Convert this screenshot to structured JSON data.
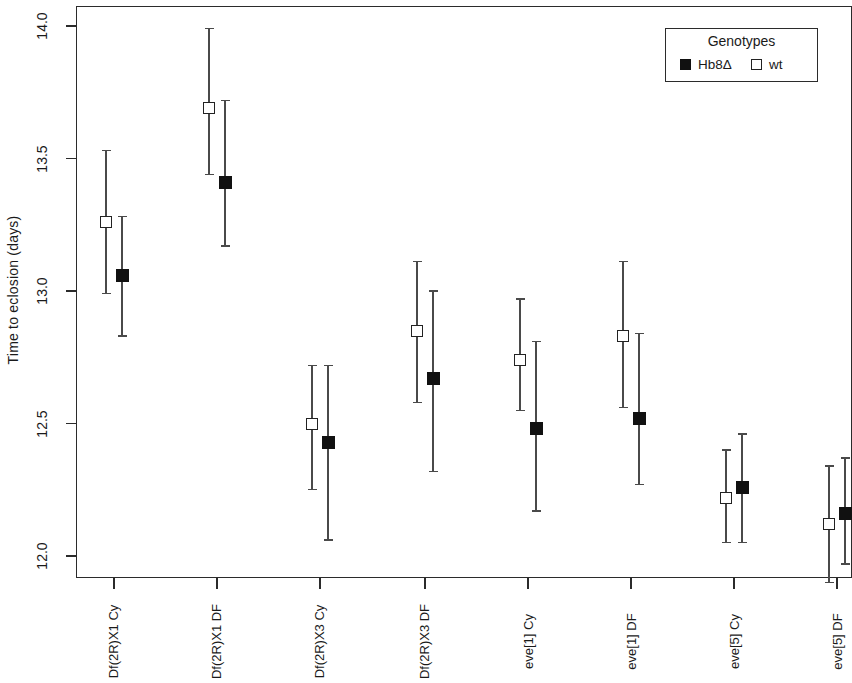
{
  "chart_data": {
    "type": "scatter",
    "title": "",
    "xlabel": "",
    "ylabel": "Time to eclosion (days)",
    "ylim": [
      12.0,
      14.0
    ],
    "yticks": [
      12.0,
      12.5,
      13.0,
      13.5,
      14.0
    ],
    "ytick_labels": [
      "12.0",
      "12.5",
      "13.0",
      "13.5",
      "14.0"
    ],
    "grid": false,
    "legend": {
      "title": "Genotypes",
      "position": "top-right",
      "entries": [
        {
          "label": "Hb8Δ",
          "marker": "filled-square",
          "color": "#111111"
        },
        {
          "label": "wt",
          "marker": "open-square",
          "color": "#ffffff"
        }
      ]
    },
    "categories": [
      "Df(2R)X1 Cy",
      "Df(2R)X1 DF",
      "Df(2R)X3 Cy",
      "Df(2R)X3 DF",
      "eve[1] Cy",
      "eve[1] DF",
      "eve[5] Cy",
      "eve[5] DF"
    ],
    "series": [
      {
        "name": "wt",
        "marker": "open-square",
        "values": [
          13.26,
          13.69,
          12.5,
          12.85,
          12.74,
          12.83,
          12.22,
          12.12
        ],
        "ci_lower": [
          12.99,
          13.44,
          12.25,
          12.58,
          12.55,
          12.56,
          12.05,
          11.9
        ],
        "ci_upper": [
          13.53,
          13.99,
          12.72,
          13.11,
          12.97,
          13.11,
          12.4,
          12.34
        ]
      },
      {
        "name": "Hb8Δ",
        "marker": "filled-square",
        "values": [
          13.06,
          13.41,
          12.43,
          12.67,
          12.48,
          12.52,
          12.26,
          12.16
        ],
        "ci_lower": [
          12.83,
          13.17,
          12.06,
          12.32,
          12.17,
          12.27,
          12.05,
          11.97
        ],
        "ci_upper": [
          13.28,
          13.72,
          12.72,
          13.0,
          12.81,
          12.84,
          12.46,
          12.37
        ]
      }
    ]
  }
}
